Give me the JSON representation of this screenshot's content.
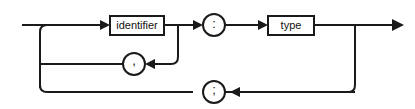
{
  "diagram": {
    "kind": "railroad-syntax-diagram",
    "title": "",
    "background_color": "#ffffff",
    "line_color": "#1a1a1a",
    "box_fill": "#ffffff",
    "text_color": "#111111",
    "nodes": {
      "identifier": {
        "label": "identifier",
        "shape": "rectangle",
        "x": 110,
        "y": 16,
        "width": 54,
        "height": 19
      },
      "type": {
        "label": "type",
        "shape": "rectangle",
        "x": 268,
        "y": 16,
        "width": 46,
        "height": 19
      },
      "colon": {
        "label": ":",
        "shape": "circle",
        "cx": 214,
        "cy": 25,
        "r": 11
      },
      "comma": {
        "label": ",",
        "shape": "circle",
        "cx": 134,
        "cy": 64,
        "r": 11
      },
      "semicolon": {
        "label": ";",
        "shape": "circle",
        "cx": 214,
        "cy": 92,
        "r": 11
      }
    },
    "entry": {
      "label": "",
      "x": 22,
      "y": 25
    },
    "exit": {
      "label": "",
      "x": 402,
      "y": 25
    },
    "arrow_count": 6,
    "loops": [
      {
        "name": "comma-repeat-loop",
        "element": ","
      },
      {
        "name": "semicolon-repeat-loop",
        "element": ";"
      }
    ]
  }
}
